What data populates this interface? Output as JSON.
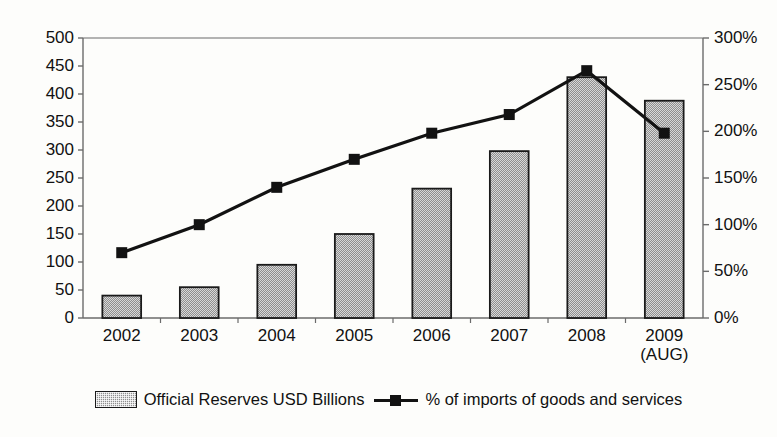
{
  "chart_data": {
    "type": "bar",
    "title": "",
    "xlabel": "",
    "categories": [
      "2002",
      "2003",
      "2004",
      "2005",
      "2006",
      "2007",
      "2008",
      "2009\n(AUG)"
    ],
    "grid": false,
    "legend_position": "bottom",
    "series": [
      {
        "name": "Official Reserves USD Billions",
        "type": "bar",
        "axis": "left",
        "values": [
          40,
          55,
          95,
          150,
          231,
          298,
          430,
          388
        ]
      },
      {
        "name": "% of imports of goods and services",
        "type": "line",
        "axis": "right",
        "values": [
          70,
          100,
          140,
          170,
          198,
          218,
          265,
          198
        ]
      }
    ],
    "left_axis": {
      "label": "",
      "ylim": [
        0,
        500
      ],
      "tick_step": 50,
      "ticks": [
        "0",
        "50",
        "100",
        "150",
        "200",
        "250",
        "300",
        "350",
        "400",
        "450",
        "500"
      ]
    },
    "right_axis": {
      "label": "",
      "ylim": [
        0,
        300
      ],
      "tick_step": 50,
      "ticks": [
        "0%",
        "50%",
        "100%",
        "150%",
        "200%",
        "250%",
        "300%"
      ]
    },
    "colors": {
      "bar_fill": "#8f8f8f",
      "bar_stroke": "#1a1a1a",
      "line": "#121212",
      "marker": "#121212",
      "axis": "#6b6b6b",
      "text": "#111111",
      "background": "#fdfdfb"
    }
  },
  "legend": {
    "items": [
      {
        "label": "Official Reserves USD Billions",
        "marker": "bar-swatch"
      },
      {
        "label": "% of imports of goods and services",
        "marker": "line-square-swatch"
      }
    ]
  }
}
